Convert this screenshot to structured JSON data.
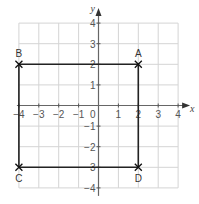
{
  "diagram": {
    "type": "coordinate-grid",
    "x_axis": {
      "label": "x",
      "min": -4,
      "max": 4,
      "ticks": [
        "-4",
        "-3",
        "-2",
        "-1",
        "0",
        "1",
        "2",
        "3",
        "4"
      ]
    },
    "y_axis": {
      "label": "y",
      "min": -4,
      "max": 4,
      "ticks": [
        "4",
        "3",
        "2",
        "1",
        "-1",
        "-2",
        "-3",
        "-4"
      ]
    },
    "origin_label": "0",
    "points": [
      {
        "name": "A",
        "x": 2,
        "y": 2
      },
      {
        "name": "B",
        "x": -4,
        "y": 2
      },
      {
        "name": "C",
        "x": -4,
        "y": -3
      },
      {
        "name": "D",
        "x": 2,
        "y": -3
      }
    ],
    "shape": "rectangle ABDC",
    "colors": {
      "grid": "#d4d4d4",
      "axis": "#666666",
      "shape": "#222222"
    }
  }
}
